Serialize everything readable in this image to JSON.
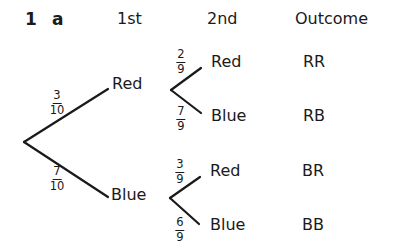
{
  "question": {
    "number": "1",
    "part": "a"
  },
  "headers": {
    "first": "1st",
    "second": "2nd",
    "outcome": "Outcome"
  },
  "first_draw": [
    {
      "label": "Red",
      "probability": {
        "numerator": "3",
        "denominator": "10"
      }
    },
    {
      "label": "Blue",
      "probability": {
        "numerator": "7",
        "denominator": "10"
      }
    }
  ],
  "second_draw": [
    {
      "parent": "Red",
      "label": "Red",
      "probability": {
        "numerator": "2",
        "denominator": "9"
      },
      "outcome": "RR"
    },
    {
      "parent": "Red",
      "label": "Blue",
      "probability": {
        "numerator": "7",
        "denominator": "9"
      },
      "outcome": "RB"
    },
    {
      "parent": "Blue",
      "label": "Red",
      "probability": {
        "numerator": "3",
        "denominator": "9"
      },
      "outcome": "BR"
    },
    {
      "parent": "Blue",
      "label": "Blue",
      "probability": {
        "numerator": "6",
        "denominator": "9"
      },
      "outcome": "BB"
    }
  ],
  "colors": {
    "ink": "#1a1a1a",
    "background": "#ffffff"
  }
}
